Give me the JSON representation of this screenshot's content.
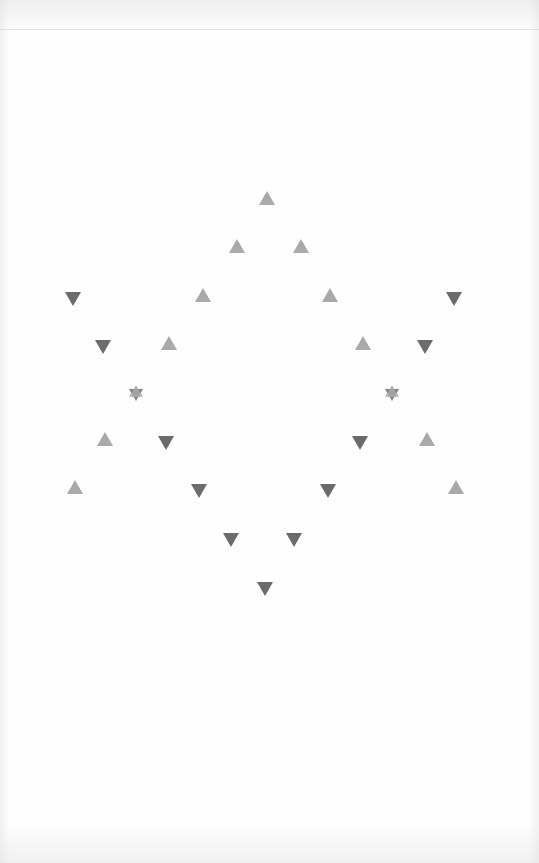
{
  "colors": {
    "up_triangle": "#a9a9a9",
    "down_triangle": "#6b6b6b",
    "background": "#fefefe"
  },
  "figure": {
    "marks": [
      {
        "id": "up-top",
        "shape": "triangle-up"
      },
      {
        "id": "up-2a",
        "shape": "triangle-up"
      },
      {
        "id": "up-2b",
        "shape": "triangle-up"
      },
      {
        "id": "up-3a",
        "shape": "triangle-up"
      },
      {
        "id": "up-3b",
        "shape": "triangle-up"
      },
      {
        "id": "up-4a",
        "shape": "triangle-up"
      },
      {
        "id": "up-4b",
        "shape": "triangle-up"
      },
      {
        "id": "up-6a",
        "shape": "triangle-up"
      },
      {
        "id": "up-6b",
        "shape": "triangle-up"
      },
      {
        "id": "up-7a",
        "shape": "triangle-up"
      },
      {
        "id": "up-7b",
        "shape": "triangle-up"
      },
      {
        "id": "down-1a",
        "shape": "triangle-down"
      },
      {
        "id": "down-1b",
        "shape": "triangle-down"
      },
      {
        "id": "down-2a",
        "shape": "triangle-down"
      },
      {
        "id": "down-2b",
        "shape": "triangle-down"
      },
      {
        "id": "down-4a",
        "shape": "triangle-down"
      },
      {
        "id": "down-4b",
        "shape": "triangle-down"
      },
      {
        "id": "down-5a",
        "shape": "triangle-down"
      },
      {
        "id": "down-5b",
        "shape": "triangle-down"
      },
      {
        "id": "down-6a",
        "shape": "triangle-down"
      },
      {
        "id": "down-6b",
        "shape": "triangle-down"
      },
      {
        "id": "down-bottom",
        "shape": "triangle-down"
      },
      {
        "id": "star-left",
        "shape": "hexagram"
      },
      {
        "id": "star-right",
        "shape": "hexagram"
      }
    ]
  }
}
